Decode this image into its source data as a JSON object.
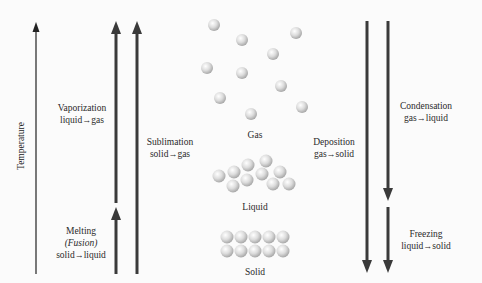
{
  "axis": {
    "label": "Temperature"
  },
  "transitions": {
    "vaporization": {
      "name": "Vaporization",
      "from": "liquid",
      "to": "gas",
      "direction": "up"
    },
    "melting": {
      "name": "Melting",
      "alt": "(Fusion)",
      "from": "solid",
      "to": "liquid",
      "direction": "up"
    },
    "sublimation": {
      "name": "Sublimation",
      "from": "solid",
      "to": "gas",
      "direction": "up"
    },
    "deposition": {
      "name": "Deposition",
      "from": "gas",
      "to": "solid",
      "direction": "down"
    },
    "condensation": {
      "name": "Condensation",
      "from": "gas",
      "to": "liquid",
      "direction": "down"
    },
    "freezing": {
      "name": "Freezing",
      "from": "liquid",
      "to": "solid",
      "direction": "down"
    }
  },
  "states": {
    "gas": {
      "label": "Gas"
    },
    "liquid": {
      "label": "Liquid"
    },
    "solid": {
      "label": "Solid"
    }
  },
  "arrow_glyph": "→",
  "colors": {
    "arrow": "#3a3a3a",
    "thin_arrow": "#222222",
    "particle": "#d6d6d6",
    "background": "#fbfbfb"
  }
}
